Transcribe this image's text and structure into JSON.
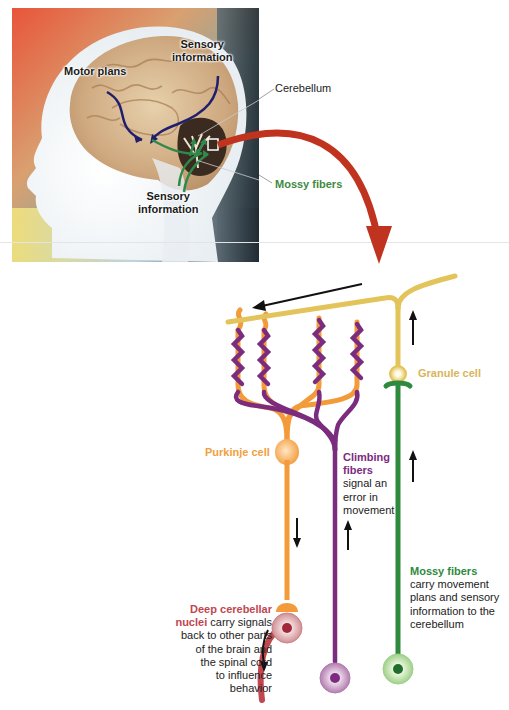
{
  "brain_panel": {
    "labels": {
      "motor_plans": "Motor plans",
      "sensory_top_line1": "Sensory",
      "sensory_top_line2": "information",
      "sensory_bottom_line1": "Sensory",
      "sensory_bottom_line2": "information"
    },
    "callouts": {
      "cerebellum": "Cerebellum",
      "mossy_fibers": "Mossy fibers"
    }
  },
  "circuit": {
    "granule_cell": "Granule cell",
    "purkinje_cell": "Purkinje cell",
    "climbing_fibers": {
      "title_line1": "Climbing",
      "title_line2": "fibers",
      "desc_lines": [
        "signal an",
        "error in",
        "movement"
      ]
    },
    "mossy_fibers": {
      "title": "Mossy fibers",
      "desc_lines": [
        "carry movement",
        "plans and sensory",
        "information to the",
        "cerebellum"
      ]
    },
    "deep_nuclei": {
      "title_line1": "Deep cerebellar",
      "title_line2_bold": "nuclei",
      "title_line2_rest": " carry signals",
      "desc_lines": [
        "back to other parts",
        "of the brain and",
        "the spinal cord",
        "to influence",
        "behavior"
      ]
    }
  },
  "colors": {
    "parallel_fiber": "#e3c45a",
    "purkinje": "#f39a3a",
    "climbing": "#7b2c7e",
    "mossy": "#2f8a3e",
    "deep_nuclei": "#c0474f",
    "zoom_arrow": "#c0341f",
    "motor_arrow": "#1f1f6e",
    "sensory_arrow": "#2e8a4a"
  }
}
